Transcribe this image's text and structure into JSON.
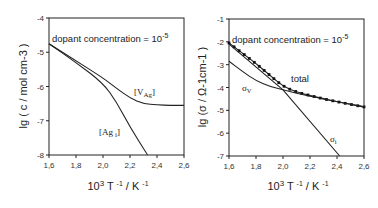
{
  "chart_data": [
    {
      "type": "line",
      "title": "",
      "annotation": "dopant concentration = 10-5",
      "xlabel": "10^3 T^-1 / K^-1",
      "ylabel": "lg ( c / mol cm-3 )",
      "xlim": [
        1.6,
        2.6
      ],
      "ylim": [
        -8,
        -4
      ],
      "x_ticks": [
        "1,6",
        "1,8",
        "2,0",
        "2,2",
        "2,4",
        "2,6"
      ],
      "y_ticks": [
        "-4",
        "-5",
        "-6",
        "-7",
        "-8"
      ],
      "grid": false,
      "series": [
        {
          "name": "[V'Ag]",
          "x": [
            1.6,
            1.8,
            2.0,
            2.1,
            2.2,
            2.3,
            2.4,
            2.5,
            2.6
          ],
          "values": [
            -4.75,
            -5.25,
            -5.75,
            -6.05,
            -6.34,
            -6.5,
            -6.54,
            -6.55,
            -6.55
          ]
        },
        {
          "name": "[Ag•i]",
          "x": [
            1.6,
            1.8,
            2.0,
            2.1,
            2.2,
            2.33
          ],
          "values": [
            -4.75,
            -5.3,
            -5.9,
            -6.45,
            -7.18,
            -8.0
          ]
        }
      ]
    },
    {
      "type": "line",
      "title": "",
      "annotation": "dopant concentration = 10-5",
      "xlabel": "10^3 T^-1 / K^-1",
      "ylabel": "lg (σ / Ω-1cm-1 )",
      "xlim": [
        1.6,
        2.6
      ],
      "ylim": [
        -7,
        -1
      ],
      "x_ticks": [
        "1,6",
        "1,8",
        "2,0",
        "2,2",
        "2,4",
        "2,6"
      ],
      "y_ticks": [
        "-1",
        "-2",
        "-3",
        "-4",
        "-5",
        "-6",
        "-7"
      ],
      "grid": false,
      "series": [
        {
          "name": "total",
          "style": "dotted-markers",
          "x": [
            1.6,
            1.7,
            1.8,
            1.9,
            2.0,
            2.1,
            2.2,
            2.3,
            2.4,
            2.5,
            2.6
          ],
          "values": [
            -2.05,
            -2.5,
            -2.95,
            -3.45,
            -3.95,
            -4.2,
            -4.35,
            -4.5,
            -4.62,
            -4.74,
            -4.85
          ]
        },
        {
          "name": "σv",
          "x": [
            1.6,
            1.7,
            1.8,
            1.9,
            2.0,
            2.1,
            2.2,
            2.3,
            2.4,
            2.5,
            2.6
          ],
          "values": [
            -2.85,
            -3.3,
            -3.7,
            -3.95,
            -4.1,
            -4.25,
            -4.38,
            -4.5,
            -4.62,
            -4.74,
            -4.85
          ]
        },
        {
          "name": "σi",
          "x": [
            1.6,
            2.0,
            2.42
          ],
          "values": [
            -2.1,
            -4.1,
            -7.0
          ]
        }
      ]
    }
  ],
  "left_plot": {
    "annotation_text": "dopant concentration = 10",
    "annotation_exp": "-5",
    "ylabel": "lg ( c / mol cm-3 )",
    "xlabel_base": "10",
    "xlabel_exp": "3",
    "xlabel_mid": " T ",
    "xlabel_exp2": "-1",
    "xlabel_end": " / K ",
    "xlabel_exp3": "-1",
    "curve_label_v": "[V",
    "curve_label_v_sub": "Ag",
    "curve_label_v_end": "]",
    "curve_label_ag": "[Ag",
    "curve_label_ag_sub": "i",
    "curve_label_ag_end": "]"
  },
  "right_plot": {
    "annotation_text": "dopant concentration = 10",
    "annotation_exp": "-5",
    "ylabel": "lg (σ / Ω-1cm-1 )",
    "label_total": "total",
    "label_sv": "σ",
    "label_sv_sub": "V",
    "label_si": "σ",
    "label_si_sub": "i"
  }
}
